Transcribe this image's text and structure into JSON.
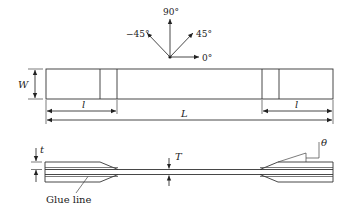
{
  "orientation": {
    "labels": {
      "deg90": "90°",
      "deg45": "45°",
      "degm45": "−45°",
      "deg0": "0°"
    }
  },
  "top_view": {
    "width_label": "W",
    "tab_length_label_left": "l",
    "tab_length_label_right": "l",
    "total_length_label": "L"
  },
  "side_view": {
    "tab_thickness_label": "t",
    "specimen_thickness_label": "T",
    "taper_angle_label": "θ",
    "glue_line_label": "Glue line"
  }
}
